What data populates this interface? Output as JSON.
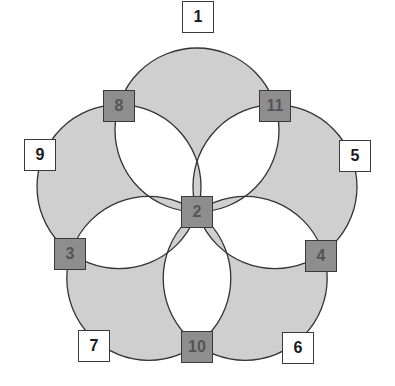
{
  "diagram": {
    "type": "five-circle-flower",
    "center": [
      197,
      212
    ],
    "circle_offset": 82,
    "circle_radius": 82,
    "circle_angles_deg": [
      -90,
      -18,
      54,
      126,
      198
    ],
    "colors": {
      "petal_fill": "#cfcfcf",
      "stroke": "#333333",
      "dark_box": "#8e8e8e",
      "white_box": "#ffffff"
    },
    "nodes": [
      {
        "label": "1",
        "x": 198,
        "y": 17,
        "style": "white"
      },
      {
        "label": "8",
        "x": 119,
        "y": 106,
        "style": "dark"
      },
      {
        "label": "11",
        "x": 275,
        "y": 106,
        "style": "dark"
      },
      {
        "label": "9",
        "x": 40,
        "y": 155,
        "style": "white"
      },
      {
        "label": "5",
        "x": 355,
        "y": 156,
        "style": "white"
      },
      {
        "label": "2",
        "x": 197,
        "y": 212,
        "style": "dark"
      },
      {
        "label": "3",
        "x": 70,
        "y": 254,
        "style": "dark"
      },
      {
        "label": "4",
        "x": 321,
        "y": 256,
        "style": "dark"
      },
      {
        "label": "7",
        "x": 94,
        "y": 346,
        "style": "white"
      },
      {
        "label": "10",
        "x": 197,
        "y": 347,
        "style": "dark"
      },
      {
        "label": "6",
        "x": 298,
        "y": 348,
        "style": "white"
      }
    ]
  }
}
